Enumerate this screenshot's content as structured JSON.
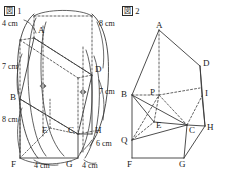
{
  "figures": [
    {
      "id": "fig1",
      "caption_prefix": "図",
      "caption_number": "1",
      "vertices": [
        {
          "name": "A",
          "label": "A",
          "x": 38,
          "y": 33
        },
        {
          "name": "B",
          "label": "B",
          "x": 16,
          "y": 97
        },
        {
          "name": "C",
          "label": "C",
          "x": 75,
          "y": 130
        },
        {
          "name": "D",
          "label": "D",
          "x": 97,
          "y": 70
        },
        {
          "name": "E",
          "label": "E",
          "x": 45,
          "y": 130
        },
        {
          "name": "F",
          "label": "F",
          "x": 16,
          "y": 157
        },
        {
          "name": "G",
          "label": "G",
          "x": 75,
          "y": 157
        },
        {
          "name": "H",
          "label": "H",
          "x": 97,
          "y": 130
        }
      ],
      "dimensions": [
        {
          "name": "dim-a-top",
          "text": "4 cm",
          "x": 2,
          "y": 23
        },
        {
          "name": "dim-b-left",
          "text": "7 cm",
          "x": 2,
          "y": 66
        },
        {
          "name": "dim-f-left",
          "text": "8 cm",
          "x": 2,
          "y": 117
        },
        {
          "name": "dim-top-right",
          "text": "8 cm",
          "x": 99,
          "y": 23
        },
        {
          "name": "dim-d-right",
          "text": "7 cm",
          "x": 99,
          "y": 90
        },
        {
          "name": "dim-h-right",
          "text": "6 cm",
          "x": 97,
          "y": 140
        },
        {
          "name": "dim-bottom-left",
          "text": "4 cm",
          "x": 36,
          "y": 160
        },
        {
          "name": "dim-bottom-right",
          "text": "4 cm",
          "x": 85,
          "y": 160
        }
      ]
    },
    {
      "id": "fig2",
      "caption_prefix": "図",
      "caption_number": "2",
      "vertices": [
        {
          "name": "A",
          "label": "A",
          "x": 41,
          "y": 30
        },
        {
          "name": "B",
          "label": "B",
          "x": 4,
          "y": 92
        },
        {
          "name": "C",
          "label": "C",
          "x": 68,
          "y": 128
        },
        {
          "name": "D",
          "label": "D",
          "x": 82,
          "y": 63
        },
        {
          "name": "E",
          "label": "E",
          "x": 40,
          "y": 124
        },
        {
          "name": "F",
          "label": "F",
          "x": 10,
          "y": 159
        },
        {
          "name": "G",
          "label": "G",
          "x": 63,
          "y": 159
        },
        {
          "name": "H",
          "label": "H",
          "x": 87,
          "y": 128
        },
        {
          "name": "I",
          "label": "I",
          "x": 84,
          "y": 93
        },
        {
          "name": "P",
          "label": "P",
          "x": 34,
          "y": 92
        },
        {
          "name": "Q",
          "label": "Q",
          "x": 4,
          "y": 138
        }
      ],
      "dimensions": []
    }
  ]
}
